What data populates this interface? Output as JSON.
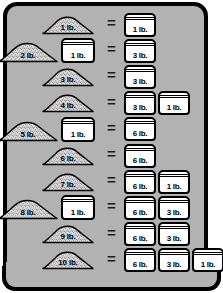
{
  "panel": {
    "background_color": "#b2b2b2",
    "border_color": "#000000"
  },
  "equals_symbol": "=",
  "units": "lb.",
  "chart_data": {
    "type": "table",
    "title": "",
    "xlabel": "",
    "ylabel": "",
    "columns": [
      "left_pile",
      "left_jar",
      "equals",
      "right_jars"
    ],
    "categories": [
      "1 lb.",
      "2 lb.",
      "3 lb.",
      "4 lb.",
      "5 lb.",
      "6 lb.",
      "7 lb.",
      "8 lb.",
      "9 lb.",
      "10 lb."
    ],
    "values": [
      1,
      2,
      3,
      4,
      5,
      6,
      7,
      8,
      9,
      10
    ],
    "rows": [
      {
        "pile": "1 lb.",
        "pile_value": 1,
        "left_jar": null,
        "left_jar_value": 0,
        "right": [
          "1 lb."
        ],
        "right_values": [
          1
        ]
      },
      {
        "pile": "2 lb.",
        "pile_value": 2,
        "left_jar": "1 lb.",
        "left_jar_value": 1,
        "right": [
          "3 lb."
        ],
        "right_values": [
          3
        ]
      },
      {
        "pile": "3 lb.",
        "pile_value": 3,
        "left_jar": null,
        "left_jar_value": 0,
        "right": [
          "3 lb."
        ],
        "right_values": [
          3
        ]
      },
      {
        "pile": "4 lb.",
        "pile_value": 4,
        "left_jar": null,
        "left_jar_value": 0,
        "right": [
          "3 lb.",
          "1 lb."
        ],
        "right_values": [
          3,
          1
        ]
      },
      {
        "pile": "5 lb.",
        "pile_value": 5,
        "left_jar": "1 lb.",
        "left_jar_value": 1,
        "right": [
          "6 lb."
        ],
        "right_values": [
          6
        ]
      },
      {
        "pile": "6 lb.",
        "pile_value": 6,
        "left_jar": null,
        "left_jar_value": 0,
        "right": [
          "6 lb."
        ],
        "right_values": [
          6
        ]
      },
      {
        "pile": "7 lb.",
        "pile_value": 7,
        "left_jar": null,
        "left_jar_value": 0,
        "right": [
          "6 lb.",
          "1 lb."
        ],
        "right_values": [
          6,
          1
        ]
      },
      {
        "pile": "8 lb.",
        "pile_value": 8,
        "left_jar": "1 lb.",
        "left_jar_value": 1,
        "right": [
          "6 lb.",
          "3 lb."
        ],
        "right_values": [
          6,
          3
        ]
      },
      {
        "pile": "9 lb.",
        "pile_value": 9,
        "left_jar": null,
        "left_jar_value": 0,
        "right": [
          "6 lb.",
          "3 lb."
        ],
        "right_values": [
          6,
          3
        ]
      },
      {
        "pile": "10 lb.",
        "pile_value": 10,
        "left_jar": null,
        "left_jar_value": 0,
        "right": [
          "6 lb.",
          "3 lb.",
          "1 lb."
        ],
        "right_values": [
          6,
          3,
          1
        ]
      }
    ]
  },
  "rows": [
    {
      "pile": "1 lb.",
      "left_jar": null,
      "right": [
        "1 lb."
      ]
    },
    {
      "pile": "2 lb.",
      "left_jar": "1 lb.",
      "right": [
        "3 lb."
      ]
    },
    {
      "pile": "3 lb.",
      "left_jar": null,
      "right": [
        "3 lb."
      ]
    },
    {
      "pile": "4 lb.",
      "left_jar": null,
      "right": [
        "3 lb.",
        "1 lb."
      ]
    },
    {
      "pile": "5 lb.",
      "left_jar": "1 lb.",
      "right": [
        "6 lb."
      ]
    },
    {
      "pile": "6 lb.",
      "left_jar": null,
      "right": [
        "6 lb."
      ]
    },
    {
      "pile": "7 lb.",
      "left_jar": null,
      "right": [
        "6 lb.",
        "1 lb."
      ]
    },
    {
      "pile": "8 lb.",
      "left_jar": "1 lb.",
      "right": [
        "6 lb.",
        "3 lb."
      ]
    },
    {
      "pile": "9 lb.",
      "left_jar": null,
      "right": [
        "6 lb.",
        "3 lb."
      ]
    },
    {
      "pile": "10 lb.",
      "left_jar": null,
      "right": [
        "6 lb.",
        "3 lb.",
        "1 lb."
      ]
    }
  ]
}
